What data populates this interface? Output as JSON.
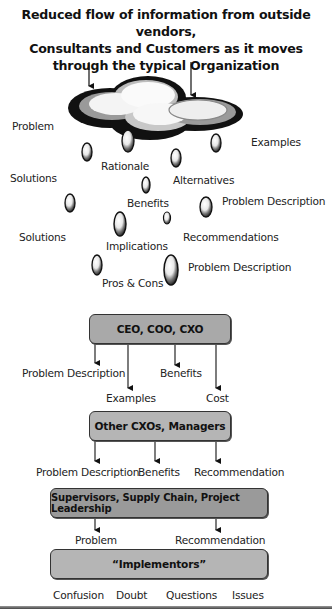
{
  "title": {
    "line1": "Reduced flow of information from outside vendors,",
    "line2": "Consultants and Customers as it moves",
    "line3": "through the typical Organization"
  },
  "cloud_section": {
    "labels": {
      "problem": "Problem",
      "examples": "Examples",
      "rationale": "Rationale",
      "solutions_1": "Solutions",
      "alternatives": "Alternatives",
      "benefits": "Benefits",
      "problem_description_1": "Problem Description",
      "solutions_2": "Solutions",
      "recommendations": "Recommendations",
      "implications": "Implications",
      "problem_description_2": "Problem Description",
      "pros_cons": "Pros & Cons"
    }
  },
  "hierarchy": {
    "level1": {
      "box": "CEO, COO, CXO",
      "outputs": [
        "Problem Description",
        "Examples",
        "Benefits",
        "Cost"
      ]
    },
    "level2": {
      "box": "Other CXOs, Managers",
      "outputs": [
        "Problem Description",
        "Benefits",
        "Recommendation"
      ]
    },
    "level3": {
      "box": "Supervisors, Supply Chain, Project Leadership",
      "outputs": [
        "Problem",
        "Recommendation"
      ]
    },
    "level4": {
      "box": "“Implementors”",
      "outputs": [
        "Confusion",
        "Doubt",
        "Questions",
        "Issues"
      ]
    }
  },
  "colors": {
    "box_fill": "#a9a9a9",
    "box_border": "#333333",
    "text": "#1a1a1a"
  }
}
